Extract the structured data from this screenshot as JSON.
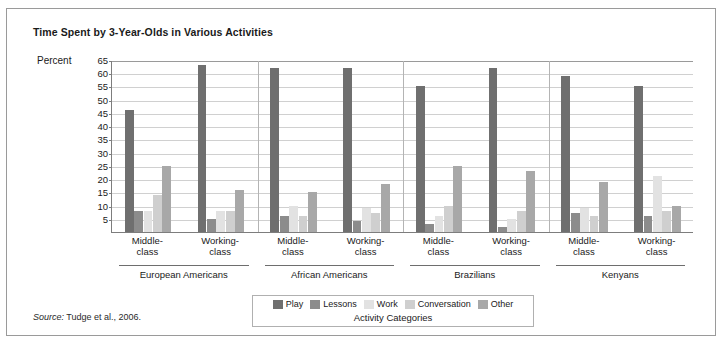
{
  "figure": {
    "title": "Time Spent by 3-Year-Olds in Various Activities",
    "y_axis_name": "Percent",
    "x_axis_title": "Activity Categories",
    "source_prefix": "Source:",
    "source_text": " Tudge et al., 2006."
  },
  "chart_data": {
    "type": "bar",
    "title": "Time Spent by 3-Year-Olds in Various Activities",
    "xlabel": "Activity Categories",
    "ylabel": "Percent",
    "ylim": [
      0,
      65
    ],
    "yticks": [
      5,
      10,
      15,
      20,
      25,
      30,
      35,
      40,
      45,
      50,
      55,
      60,
      65
    ],
    "grid": true,
    "legend_position": "bottom",
    "categories": [
      "European Americans Middle-class",
      "European Americans Working-class",
      "African Americans Middle-class",
      "African Americans Working-class",
      "Brazilians Middle-class",
      "Brazilians Working-class",
      "Kenyans Middle-class",
      "Kenyans Working-class"
    ],
    "groups": [
      {
        "name": "European Americans",
        "subgroups": [
          "Middle-class",
          "Working-class"
        ]
      },
      {
        "name": "African Americans",
        "subgroups": [
          "Middle-class",
          "Working-class"
        ]
      },
      {
        "name": "Brazilians",
        "subgroups": [
          "Middle-class",
          "Working-class"
        ]
      },
      {
        "name": "Kenyans",
        "subgroups": [
          "Middle-class",
          "Working-class"
        ]
      }
    ],
    "series": [
      {
        "name": "Play",
        "color": "#6f6f6f",
        "values": [
          46,
          63,
          62,
          62,
          55,
          62,
          59,
          55
        ]
      },
      {
        "name": "Lessons",
        "color": "#8c8c8c",
        "values": [
          8,
          5,
          6,
          4,
          3,
          2,
          7,
          6
        ]
      },
      {
        "name": "Work",
        "color": "#e2e2e2",
        "values": [
          8,
          8,
          10,
          9,
          6,
          5,
          9,
          21
        ]
      },
      {
        "name": "Conversation",
        "color": "#cfcfcf",
        "values": [
          14,
          8,
          6,
          7,
          10,
          8,
          6,
          8
        ]
      },
      {
        "name": "Other",
        "color": "#a8a8a8",
        "values": [
          25,
          16,
          15,
          18,
          25,
          23,
          19,
          10
        ]
      }
    ]
  }
}
